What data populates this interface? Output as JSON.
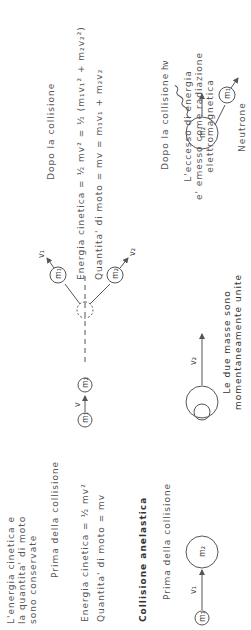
{
  "elastic": {
    "intro": [
      "L'energia cinetica e",
      "la quantita' di moto",
      "sono conservate"
    ],
    "before_label": "Prima della collisione",
    "after_label": "Dopo la collisione",
    "before_energy": "Energia cinetica = ½ mv²",
    "before_momentum": "Quantita' di moto = mv",
    "after_energy": "Energia cinetica = ½ mv² = ½ (m₁v₁² + m₂v₂²)",
    "after_momentum": "Quantita' di moto = mv = m₁v₁ + m₂v₂"
  },
  "inelastic": {
    "title": "Collisione anelastica",
    "before_label": "Prima della collisione",
    "after_label": "Dopo la collisione",
    "merged_caption": [
      "Le due masse sono",
      "momentaneamente unite"
    ],
    "excess_caption": [
      "L'eccesso di energia",
      "e' emesso come radiazione",
      "elettromagnetica"
    ],
    "neutron_label": "Neutrone",
    "photon_label": "hν"
  },
  "labels": {
    "m1": "m₁",
    "m2": "m₂",
    "v": "v",
    "v1": "v₁",
    "v2": "v₂"
  }
}
